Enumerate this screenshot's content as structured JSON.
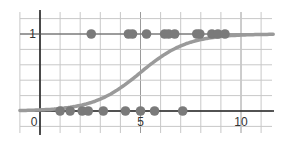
{
  "chart_data": {
    "type": "scatter",
    "title": "",
    "xlabel": "",
    "ylabel": "",
    "xlim": [
      -1,
      11.6
    ],
    "ylim": [
      -0.28,
      1.3
    ],
    "grid": true,
    "x_tick_labels": [
      "0",
      "5",
      "10"
    ],
    "y_tick_labels": [
      "1"
    ],
    "x_ticks": [
      0,
      5,
      10
    ],
    "y_ticks": [
      1
    ],
    "x_grid_step": 1,
    "y_grid_step": 0.2,
    "series": [
      {
        "name": "observations y=0",
        "type": "scatter",
        "x": [
          1.0,
          1.5,
          2.1,
          2.4,
          3.15,
          4.25,
          5.0,
          5.7,
          7.1
        ],
        "y": [
          0,
          0,
          0,
          0,
          0,
          0,
          0,
          0,
          0
        ]
      },
      {
        "name": "observations y=1",
        "type": "scatter",
        "x": [
          2.55,
          4.4,
          4.6,
          5.3,
          6.2,
          6.4,
          6.7,
          7.8,
          7.95,
          8.55,
          8.85,
          9.2
        ],
        "y": [
          1,
          1,
          1,
          1,
          1,
          1,
          1,
          1,
          1,
          1,
          1,
          1
        ]
      },
      {
        "name": "logistic fit",
        "type": "line",
        "model": "1/(1+exp(-k*(x-x0)))",
        "x0": 5.0,
        "k": 0.85
      }
    ],
    "legend": null
  },
  "colors": {
    "grid": "#c8c8c8",
    "axis": "#222222",
    "points": "#7a7a7a",
    "curve": "#9a9a9a"
  }
}
